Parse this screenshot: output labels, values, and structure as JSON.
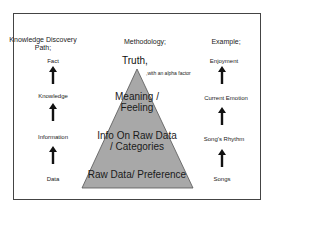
{
  "diagram": {
    "left_column": {
      "header": "Knowledge Discovery Path;",
      "items": [
        "Fact",
        "Knowledge",
        "Information",
        "Data"
      ]
    },
    "middle_column": {
      "header": "Methodology;",
      "apex_label": "Truth,",
      "apex_note": ",with an alpha factor",
      "pyramid_levels": [
        "Meaning / Feeling",
        "Info On Raw Data / Categories",
        "Raw Data/ Preference"
      ],
      "pyramid_fill": "#a8a8a8",
      "pyramid_stroke": "#555555"
    },
    "right_column": {
      "header": "Example;",
      "items": [
        "Enjoyment",
        "Current Emotion",
        "Song's Rhythm",
        "Songs"
      ]
    },
    "arrow_color": "#111111"
  }
}
